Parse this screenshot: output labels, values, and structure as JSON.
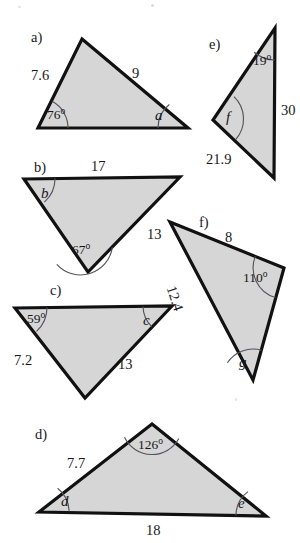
{
  "page": {
    "background_color": "#ffffff",
    "fill_color": "#d6d6d6",
    "outline_color": "#111111",
    "arc_color": "#55535a"
  },
  "figures": [
    {
      "id": "a",
      "part_label": "a)",
      "vertices": "82,39 188,128 38,128",
      "side_labels": [
        {
          "text": "7.6",
          "name": "side-label-7-6"
        },
        {
          "text": "9",
          "name": "side-label-9"
        }
      ],
      "angle_labels": [
        {
          "text": "76",
          "unit": "o",
          "name": "angle-label-76-deg"
        },
        {
          "text": "a",
          "name": "angle-label-a"
        }
      ]
    },
    {
      "id": "b",
      "part_label": "b)",
      "vertices": "24,179 180,177 88,272",
      "side_labels": [
        {
          "text": "17",
          "name": "side-label-17"
        },
        {
          "text": "13",
          "name": "side-label-13"
        }
      ],
      "angle_labels": [
        {
          "text": "b",
          "name": "angle-label-b"
        },
        {
          "text": "67",
          "unit": "o",
          "name": "angle-label-67-deg"
        }
      ]
    },
    {
      "id": "c",
      "part_label": "c)",
      "vertices": "15,308 172,306 85,398",
      "side_labels": [
        {
          "text": "7.2",
          "name": "side-label-7-2"
        },
        {
          "text": "13",
          "name": "side-label-13"
        }
      ],
      "angle_labels": [
        {
          "text": "59",
          "unit": "o",
          "name": "angle-label-59-deg"
        },
        {
          "text": "c",
          "name": "angle-label-c"
        }
      ]
    },
    {
      "id": "d",
      "part_label": "d)",
      "vertices": "152,424 266,516 39,512",
      "side_labels": [
        {
          "text": "7.7",
          "name": "side-label-7-7"
        },
        {
          "text": "18",
          "name": "side-label-18"
        }
      ],
      "angle_labels": [
        {
          "text": "126",
          "unit": "o",
          "name": "angle-label-126-deg"
        },
        {
          "text": "d",
          "name": "angle-label-d"
        },
        {
          "text": "e",
          "name": "angle-label-e"
        }
      ]
    },
    {
      "id": "e",
      "part_label": "e)",
      "vertices": "275,28 274,178 213,120",
      "side_labels": [
        {
          "text": "30",
          "name": "side-label-30"
        },
        {
          "text": "21.9",
          "name": "side-label-21-9"
        }
      ],
      "angle_labels": [
        {
          "text": "19",
          "unit": "o",
          "name": "angle-label-19-deg"
        },
        {
          "text": "f",
          "name": "angle-label-f"
        }
      ]
    },
    {
      "id": "f",
      "part_label": "f)",
      "vertices": "170,222 284,268 253,380",
      "side_labels": [
        {
          "text": "8",
          "name": "side-label-8"
        },
        {
          "text": "12.4",
          "name": "side-label-12-4"
        }
      ],
      "angle_labels": [
        {
          "text": "110",
          "unit": "o",
          "name": "angle-label-110-deg"
        },
        {
          "text": "g",
          "name": "angle-label-g"
        }
      ]
    }
  ],
  "labels": {
    "part_a": "a)",
    "part_b": "b)",
    "part_c": "c)",
    "part_d": "d)",
    "part_e": "e)",
    "part_f": "f)",
    "a_side_7_6": "7.6",
    "a_side_9": "9",
    "a_angle_76": "76",
    "a_angle_a": "a",
    "b_side_17": "17",
    "b_side_13": "13",
    "b_angle_b": "b",
    "b_angle_67": "67",
    "c_angle_59": "59",
    "c_angle_c": "c",
    "c_side_7_2": "7.2",
    "c_side_13": "13",
    "d_angle_126": "126",
    "d_side_7_7": "7.7",
    "d_angle_d": "d",
    "d_angle_e": "e",
    "d_side_18": "18",
    "e_angle_19": "19",
    "e_side_30": "30",
    "e_angle_f": "f",
    "e_side_21_9": "21.9",
    "f_side_8": "8",
    "f_angle_110": "110",
    "f_side_12_4": "12.4",
    "f_angle_g": "g",
    "degree_symbol": "o"
  }
}
